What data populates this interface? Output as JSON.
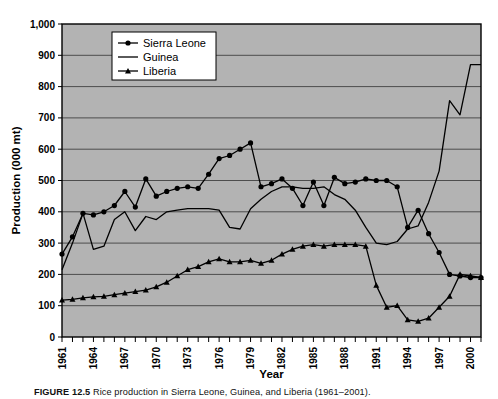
{
  "figure": {
    "caption_label": "FIGURE 12.5",
    "caption_text": "Rice production in Sierra Leone, Guinea, and Liberia (1961–2001)."
  },
  "axes": {
    "xlabel": "Year",
    "ylabel": "Production (000 mt)",
    "y_ticks": [
      "0",
      "100",
      "200",
      "300",
      "400",
      "500",
      "600",
      "700",
      "800",
      "900",
      "1,000"
    ],
    "x_ticks": [
      "1961",
      "1964",
      "1967",
      "1970",
      "1973",
      "1976",
      "1979",
      "1982",
      "1985",
      "1988",
      "1991",
      "1994",
      "1997",
      "2000"
    ],
    "plot_bg": "#b3b3b3",
    "grid_color": "#4d4d4d",
    "frame_color": "#000000"
  },
  "legend": {
    "items": [
      {
        "label": "Sierra Leone",
        "marker": "circle"
      },
      {
        "label": "Guinea",
        "marker": "none"
      },
      {
        "label": "Liberia",
        "marker": "triangle"
      }
    ]
  },
  "chart_data": {
    "type": "line",
    "title": "",
    "xlabel": "Year",
    "ylabel": "Production (000 mt)",
    "xlim": [
      1961,
      2001
    ],
    "ylim": [
      0,
      1000
    ],
    "grid": true,
    "legend_position": "top-left-inside",
    "x": [
      1961,
      1962,
      1963,
      1964,
      1965,
      1966,
      1967,
      1968,
      1969,
      1970,
      1971,
      1972,
      1973,
      1974,
      1975,
      1976,
      1977,
      1978,
      1979,
      1980,
      1981,
      1982,
      1983,
      1984,
      1985,
      1986,
      1987,
      1988,
      1989,
      1990,
      1991,
      1992,
      1993,
      1994,
      1995,
      1996,
      1997,
      1998,
      1999,
      2000,
      2001
    ],
    "series": [
      {
        "name": "Sierra Leone",
        "marker": "circle",
        "values": [
          265,
          320,
          395,
          390,
          400,
          420,
          465,
          415,
          505,
          450,
          465,
          475,
          480,
          475,
          520,
          570,
          580,
          600,
          620,
          480,
          490,
          505,
          475,
          420,
          495,
          420,
          510,
          490,
          495,
          505,
          500,
          500,
          480,
          350,
          405,
          330,
          270,
          200,
          195,
          190,
          190
        ]
      },
      {
        "name": "Guinea",
        "marker": "none",
        "values": [
          215,
          300,
          395,
          280,
          290,
          375,
          400,
          340,
          385,
          375,
          400,
          405,
          410,
          410,
          410,
          405,
          350,
          345,
          410,
          440,
          465,
          480,
          480,
          475,
          475,
          480,
          455,
          440,
          405,
          350,
          300,
          295,
          305,
          345,
          355,
          430,
          530,
          755,
          710,
          870,
          870
        ]
      },
      {
        "name": "Liberia",
        "marker": "triangle",
        "values": [
          118,
          120,
          125,
          128,
          130,
          135,
          140,
          145,
          150,
          160,
          175,
          195,
          215,
          225,
          240,
          250,
          240,
          240,
          245,
          235,
          245,
          265,
          280,
          290,
          295,
          290,
          295,
          295,
          295,
          290,
          165,
          95,
          100,
          55,
          50,
          60,
          95,
          130,
          200,
          195,
          190
        ]
      }
    ]
  }
}
